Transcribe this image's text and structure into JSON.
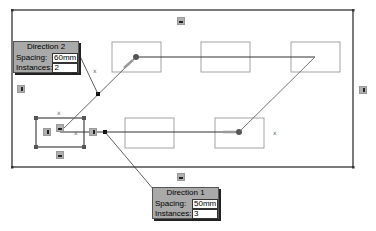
{
  "sketch": {
    "outer_rectangle": {
      "x1": 12,
      "y1": 10,
      "x2": 353,
      "y2": 167
    },
    "seed_rectangle": {
      "x1": 36,
      "y1": 118,
      "x2": 84,
      "y2": 147,
      "selected": true
    },
    "instances": [
      {
        "x1": 112,
        "y1": 42,
        "x2": 161,
        "y2": 72
      },
      {
        "x1": 201,
        "y1": 42,
        "x2": 250,
        "y2": 72
      },
      {
        "x1": 291,
        "y1": 42,
        "x2": 340,
        "y2": 72
      },
      {
        "x1": 125,
        "y1": 118,
        "x2": 174,
        "y2": 147
      },
      {
        "x1": 215,
        "y1": 118,
        "x2": 264,
        "y2": 147
      }
    ],
    "colors": {
      "line": "#333333",
      "light_line": "#888888",
      "arrow": "#777777",
      "point": "#555555"
    }
  },
  "direction1": {
    "title": "Direction 1",
    "spacing_label": "Spacing:",
    "spacing_value": "50mm",
    "instances_label": "Instances:",
    "instances_value": "3"
  },
  "direction2": {
    "title": "Direction 2",
    "spacing_label": "Spacing:",
    "spacing_value": "60mm",
    "instances_label": "Instances:",
    "instances_value": "2"
  },
  "relation_icons": [
    {
      "type": "horizontal",
      "x": 177,
      "y": 17
    },
    {
      "type": "horizontal",
      "x": 177,
      "y": 173
    },
    {
      "type": "vertical",
      "x": 17,
      "y": 85
    },
    {
      "type": "vertical",
      "x": 359,
      "y": 86
    },
    {
      "type": "vertical",
      "x": 43,
      "y": 128
    },
    {
      "type": "vertical",
      "x": 89,
      "y": 128
    },
    {
      "type": "horizontal",
      "x": 56,
      "y": 124
    },
    {
      "type": "horizontal",
      "x": 56,
      "y": 151
    }
  ]
}
